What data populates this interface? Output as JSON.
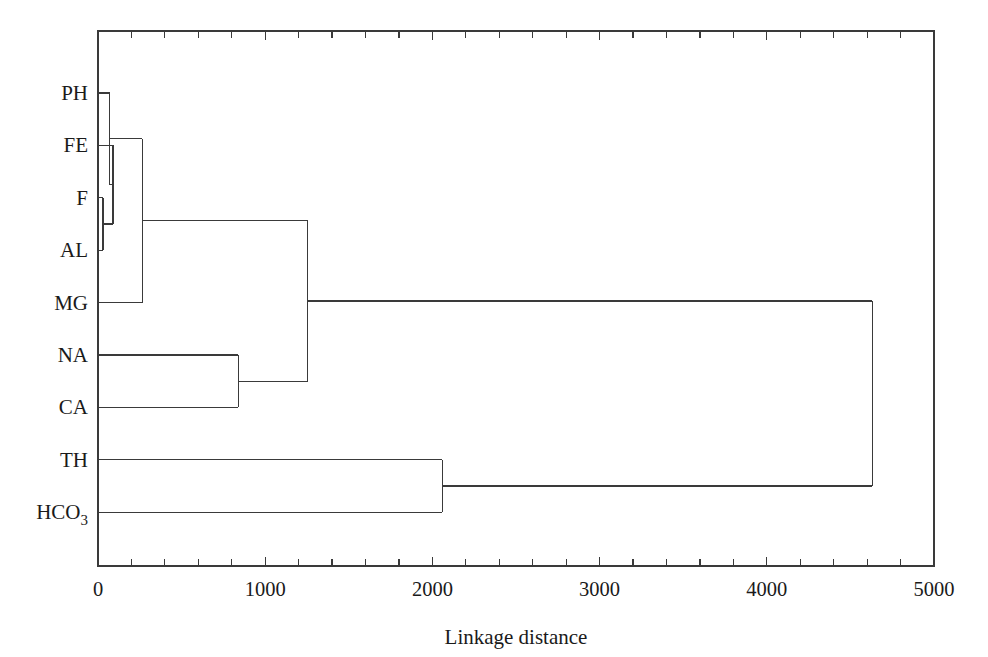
{
  "figure": {
    "type": "dendrogram",
    "background_color": "#ffffff",
    "line_color": "#3a3a3a",
    "text_color": "#1a1a1a"
  },
  "axis": {
    "xlabel": "Linkage distance",
    "x_min": 0,
    "x_max": 5000,
    "major_ticks": [
      0,
      1000,
      2000,
      3000,
      4000,
      5000
    ],
    "major_tick_labels": [
      "0",
      "1000",
      "2000",
      "3000",
      "4000",
      "5000"
    ],
    "minor_tick_step": 200,
    "ticks_top": true,
    "ticks_bottom": true,
    "grid": false
  },
  "leaves": [
    {
      "id": "PH",
      "label": "PH",
      "label_sub": ""
    },
    {
      "id": "FE",
      "label": "FE",
      "label_sub": ""
    },
    {
      "id": "F",
      "label": "F",
      "label_sub": ""
    },
    {
      "id": "AL",
      "label": "AL",
      "label_sub": ""
    },
    {
      "id": "MG",
      "label": "MG",
      "label_sub": ""
    },
    {
      "id": "NA",
      "label": "NA",
      "label_sub": ""
    },
    {
      "id": "CA",
      "label": "CA",
      "label_sub": ""
    },
    {
      "id": "TH",
      "label": "TH",
      "label_sub": ""
    },
    {
      "id": "HCO3",
      "label": "HCO",
      "label_sub": "3"
    }
  ],
  "chart_data": {
    "type": "dendrogram",
    "title": "",
    "xlabel": "Linkage distance",
    "ylabel": "",
    "xlim": [
      0,
      5000
    ],
    "orientation": "horizontal-left-to-right",
    "labels": [
      "PH",
      "FE",
      "F",
      "AL",
      "MG",
      "NA",
      "CA",
      "TH",
      "HCO3"
    ],
    "leaf_order": [
      "PH",
      "FE",
      "F",
      "AL",
      "MG",
      "NA",
      "CA",
      "TH",
      "HCO3"
    ],
    "merges": [
      {
        "id": "m1",
        "children": [
          "F",
          "AL"
        ],
        "distance": 30
      },
      {
        "id": "m2",
        "children": [
          "FE",
          "m1"
        ],
        "distance": 90
      },
      {
        "id": "m3",
        "children": [
          "PH",
          "m2"
        ],
        "distance": 70
      },
      {
        "id": "m4",
        "children": [
          "m3",
          "MG"
        ],
        "distance": 265
      },
      {
        "id": "m5",
        "children": [
          "NA",
          "CA"
        ],
        "distance": 840
      },
      {
        "id": "m6",
        "children": [
          "m4",
          "m5"
        ],
        "distance": 1255
      },
      {
        "id": "m7",
        "children": [
          "TH",
          "HCO3"
        ],
        "distance": 2060
      },
      {
        "id": "m8",
        "children": [
          "m6",
          "m7"
        ],
        "distance": 4630
      }
    ],
    "clusters": [
      {
        "name": "trace-metal group",
        "members": [
          "PH",
          "FE",
          "F",
          "AL",
          "MG"
        ]
      },
      {
        "name": "major-cation group",
        "members": [
          "NA",
          "CA"
        ]
      },
      {
        "name": "hardness-alkalinity group",
        "members": [
          "TH",
          "HCO3"
        ]
      }
    ]
  }
}
